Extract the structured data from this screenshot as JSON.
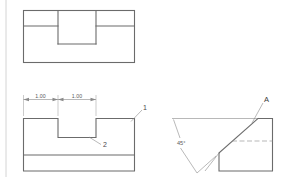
{
  "drawing": {
    "title": "Orthographic Engineering Drawing",
    "background_color": "#ffffff",
    "object_line_color": "#6b6b6b",
    "thin_line_color": "#9a9a9a",
    "dimension_line_color": "#8a8a8a",
    "hidden_line_color": "#9a9a9a",
    "border_color": "#c9c9c9"
  },
  "views": {
    "top_view": {
      "name": "top-view",
      "description": "Rectangular top view with central slot opening"
    },
    "front_view": {
      "name": "front-view",
      "description": "Front view showing a rectangular notch in the upper block with a base plate"
    },
    "right_view": {
      "name": "right-pictorial-view",
      "description": "Pictorial view with 45 degree chamfered face labeled A"
    }
  },
  "dimensions": [
    {
      "id": "dim-left",
      "value": "1.00"
    },
    {
      "id": "dim-right",
      "value": "1.00"
    }
  ],
  "callouts": [
    {
      "id": "callout-1",
      "label": "1"
    },
    {
      "id": "callout-2",
      "label": "2"
    }
  ],
  "labels": {
    "surface_a": "A",
    "angle": "45°"
  }
}
